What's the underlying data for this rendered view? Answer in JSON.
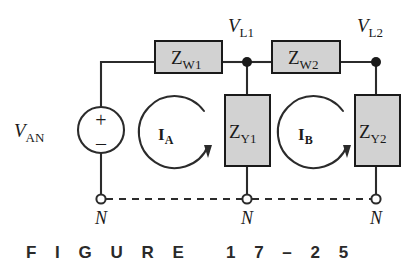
{
  "figure": {
    "caption": "F I G U R E   1 7 – 2 5",
    "caption_label": "FIGURE 17-25"
  },
  "colors": {
    "wire": "#2b2b2b",
    "box_fill": "#d2d2d2",
    "box_stroke": "#1a1a1a",
    "text": "#1a1a1a",
    "background": "#ffffff"
  },
  "source": {
    "label_main": "V",
    "label_sub": "AN",
    "plus": "+",
    "minus": "–"
  },
  "impedances": [
    {
      "id": "zw1",
      "main": "Z",
      "sub": "W1",
      "orientation": "horizontal"
    },
    {
      "id": "zw2",
      "main": "Z",
      "sub": "W2",
      "orientation": "horizontal"
    },
    {
      "id": "zy1",
      "main": "Z",
      "sub": "Y1",
      "orientation": "vertical"
    },
    {
      "id": "zy2",
      "main": "Z",
      "sub": "Y2",
      "orientation": "vertical"
    }
  ],
  "node_voltages": [
    {
      "id": "vl1",
      "main": "V",
      "sub": "L1"
    },
    {
      "id": "vl2",
      "main": "V",
      "sub": "L2"
    }
  ],
  "mesh_currents": [
    {
      "id": "ia",
      "main": "I",
      "sub": "A",
      "direction": "clockwise"
    },
    {
      "id": "ib",
      "main": "I",
      "sub": "B",
      "direction": "clockwise"
    }
  ],
  "neutral_nodes": [
    {
      "id": "n1",
      "label": "N"
    },
    {
      "id": "n2",
      "label": "N"
    },
    {
      "id": "n3",
      "label": "N"
    }
  ]
}
